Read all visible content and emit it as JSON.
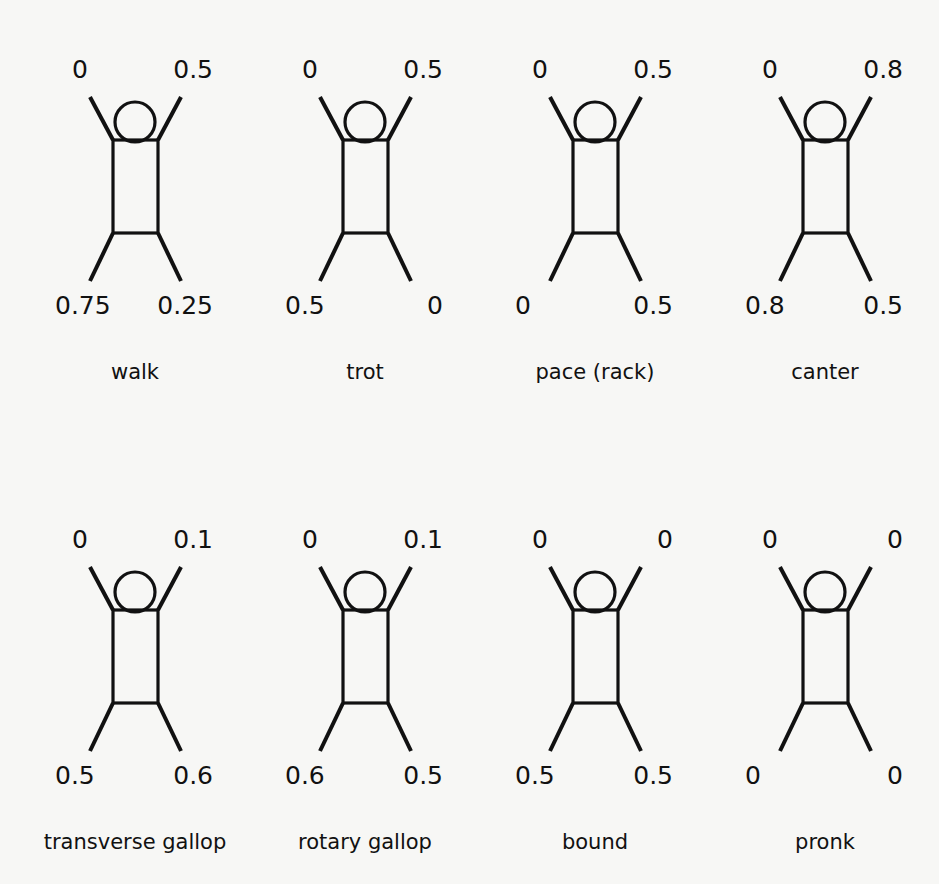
{
  "figure": {
    "stroke_color": "#111111",
    "background": "#f7f7f5",
    "gaits": [
      {
        "name": "walk",
        "front_left": "0",
        "front_right": "0.5",
        "hind_left": "0.75",
        "hind_right": "0.25"
      },
      {
        "name": "trot",
        "front_left": "0",
        "front_right": "0.5",
        "hind_left": "0.5",
        "hind_right": "0"
      },
      {
        "name": "pace (rack)",
        "front_left": "0",
        "front_right": "0.5",
        "hind_left": "0",
        "hind_right": "0.5"
      },
      {
        "name": "canter",
        "front_left": "0",
        "front_right": "0.8",
        "hind_left": "0.8",
        "hind_right": "0.5"
      },
      {
        "name": "transverse gallop",
        "front_left": "0",
        "front_right": "0.1",
        "hind_left": "0.5",
        "hind_right": "0.6"
      },
      {
        "name": "rotary gallop",
        "front_left": "0",
        "front_right": "0.1",
        "hind_left": "0.6",
        "hind_right": "0.5"
      },
      {
        "name": "bound",
        "front_left": "0",
        "front_right": "0",
        "hind_left": "0.5",
        "hind_right": "0.5"
      },
      {
        "name": "pronk",
        "front_left": "0",
        "front_right": "0",
        "hind_left": "0",
        "hind_right": "0"
      }
    ]
  }
}
